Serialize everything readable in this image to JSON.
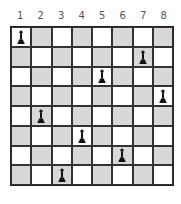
{
  "board": {
    "size": 8,
    "column_labels": [
      "1",
      "2",
      "3",
      "4",
      "5",
      "6",
      "7",
      "8"
    ],
    "colors": {
      "light": "#ffffff",
      "dark": "#d8d8d8",
      "piece": "#111111"
    },
    "pieces": [
      {
        "row": 1,
        "col": 1,
        "type": "pawn"
      },
      {
        "row": 2,
        "col": 7,
        "type": "pawn"
      },
      {
        "row": 3,
        "col": 5,
        "type": "pawn"
      },
      {
        "row": 4,
        "col": 8,
        "type": "pawn"
      },
      {
        "row": 5,
        "col": 2,
        "type": "pawn"
      },
      {
        "row": 6,
        "col": 4,
        "type": "pawn"
      },
      {
        "row": 7,
        "col": 6,
        "type": "pawn"
      },
      {
        "row": 8,
        "col": 3,
        "type": "pawn"
      }
    ]
  }
}
